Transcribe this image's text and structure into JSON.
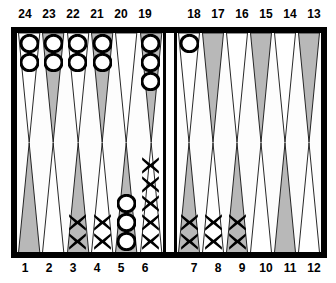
{
  "board": {
    "title": "backgammon-board",
    "colors": {
      "frame": "#000000",
      "felt": "#fdfdfd",
      "point_light": "#ffffff",
      "point_dark": "#b8b8b8",
      "checker_white": "#ffffff",
      "checker_outline": "#000000",
      "checker_dark": "#000000",
      "label_color": "#000000"
    },
    "top_labels": [
      "24",
      "23",
      "22",
      "21",
      "20",
      "19",
      "18",
      "17",
      "16",
      "15",
      "14",
      "13"
    ],
    "bottom_labels": [
      "1",
      "2",
      "3",
      "4",
      "5",
      "6",
      "7",
      "8",
      "9",
      "10",
      "11",
      "12"
    ],
    "points": [
      {
        "number": "24",
        "row": "top",
        "quadrant": "top-left",
        "slot": 0,
        "shade": "light",
        "checkers": 2,
        "checker_type": "O"
      },
      {
        "number": "23",
        "row": "top",
        "quadrant": "top-left",
        "slot": 1,
        "shade": "dark",
        "checkers": 2,
        "checker_type": "O"
      },
      {
        "number": "22",
        "row": "top",
        "quadrant": "top-left",
        "slot": 2,
        "shade": "light",
        "checkers": 2,
        "checker_type": "O"
      },
      {
        "number": "21",
        "row": "top",
        "quadrant": "top-left",
        "slot": 3,
        "shade": "dark",
        "checkers": 2,
        "checker_type": "O"
      },
      {
        "number": "20",
        "row": "top",
        "quadrant": "top-left",
        "slot": 4,
        "shade": "light",
        "checkers": 0,
        "checker_type": ""
      },
      {
        "number": "19",
        "row": "top",
        "quadrant": "top-left",
        "slot": 5,
        "shade": "dark",
        "checkers": 3,
        "checker_type": "O"
      },
      {
        "number": "18",
        "row": "top",
        "quadrant": "top-right",
        "slot": 0,
        "shade": "light",
        "checkers": 1,
        "checker_type": "O"
      },
      {
        "number": "17",
        "row": "top",
        "quadrant": "top-right",
        "slot": 1,
        "shade": "dark",
        "checkers": 0,
        "checker_type": ""
      },
      {
        "number": "16",
        "row": "top",
        "quadrant": "top-right",
        "slot": 2,
        "shade": "light",
        "checkers": 0,
        "checker_type": ""
      },
      {
        "number": "15",
        "row": "top",
        "quadrant": "top-right",
        "slot": 3,
        "shade": "dark",
        "checkers": 0,
        "checker_type": ""
      },
      {
        "number": "14",
        "row": "top",
        "quadrant": "top-right",
        "slot": 4,
        "shade": "light",
        "checkers": 0,
        "checker_type": ""
      },
      {
        "number": "13",
        "row": "top",
        "quadrant": "top-right",
        "slot": 5,
        "shade": "dark",
        "checkers": 0,
        "checker_type": ""
      },
      {
        "number": "1",
        "row": "bottom",
        "quadrant": "bot-left",
        "slot": 0,
        "shade": "dark",
        "checkers": 0,
        "checker_type": ""
      },
      {
        "number": "2",
        "row": "bottom",
        "quadrant": "bot-left",
        "slot": 1,
        "shade": "light",
        "checkers": 0,
        "checker_type": ""
      },
      {
        "number": "3",
        "row": "bottom",
        "quadrant": "bot-left",
        "slot": 2,
        "shade": "dark",
        "checkers": 2,
        "checker_type": "X"
      },
      {
        "number": "4",
        "row": "bottom",
        "quadrant": "bot-left",
        "slot": 3,
        "shade": "light",
        "checkers": 2,
        "checker_type": "X"
      },
      {
        "number": "5",
        "row": "bottom",
        "quadrant": "bot-left",
        "slot": 4,
        "shade": "dark",
        "checkers": 3,
        "checker_type": "O"
      },
      {
        "number": "6",
        "row": "bottom",
        "quadrant": "bot-left",
        "slot": 5,
        "shade": "light",
        "checkers": 5,
        "checker_type": "X"
      },
      {
        "number": "7",
        "row": "bottom",
        "quadrant": "bot-right",
        "slot": 0,
        "shade": "dark",
        "checkers": 2,
        "checker_type": "X"
      },
      {
        "number": "8",
        "row": "bottom",
        "quadrant": "bot-right",
        "slot": 1,
        "shade": "light",
        "checkers": 2,
        "checker_type": "X"
      },
      {
        "number": "9",
        "row": "bottom",
        "quadrant": "bot-right",
        "slot": 2,
        "shade": "dark",
        "checkers": 2,
        "checker_type": "X"
      },
      {
        "number": "10",
        "row": "bottom",
        "quadrant": "bot-right",
        "slot": 3,
        "shade": "light",
        "checkers": 0,
        "checker_type": ""
      },
      {
        "number": "11",
        "row": "bottom",
        "quadrant": "bot-right",
        "slot": 4,
        "shade": "dark",
        "checkers": 0,
        "checker_type": ""
      },
      {
        "number": "12",
        "row": "bottom",
        "quadrant": "bot-right",
        "slot": 5,
        "shade": "light",
        "checkers": 0,
        "checker_type": ""
      }
    ],
    "bar": {
      "white_on_bar": 0,
      "dark_on_bar": 0
    }
  }
}
